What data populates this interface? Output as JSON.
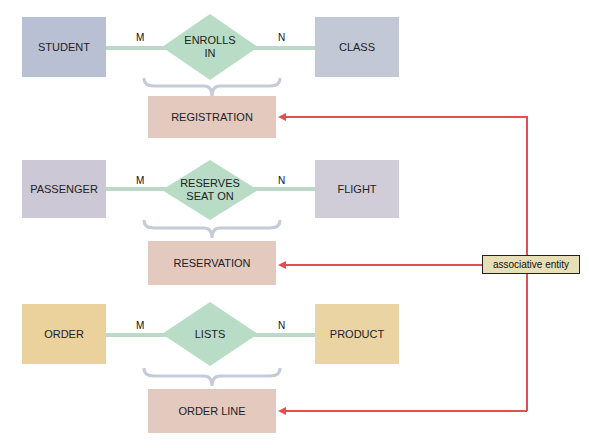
{
  "colors": {
    "student": "#b9c0d4",
    "class": "#c2c8d6",
    "passenger": "#cdc8d6",
    "flight": "#d0ccd8",
    "order": "#ebd19b",
    "product": "#ebd4a3",
    "relationship": "#b8dcc5",
    "associative": "#e4c9bf",
    "connector": "#bcd9c7",
    "arrow": "#e05050",
    "label_bg": "#e6dfb8"
  },
  "rows": [
    {
      "left_entity": "STUDENT",
      "right_entity": "CLASS",
      "relationship": "ENROLLS\nIN",
      "left_cardinality": "M",
      "right_cardinality": "N",
      "associative_entity": "REGISTRATION"
    },
    {
      "left_entity": "PASSENGER",
      "right_entity": "FLIGHT",
      "relationship": "RESERVES\nSEAT ON",
      "left_cardinality": "M",
      "right_cardinality": "N",
      "associative_entity": "RESERVATION"
    },
    {
      "left_entity": "ORDER",
      "right_entity": "PRODUCT",
      "relationship": "LISTS",
      "left_cardinality": "M",
      "right_cardinality": "N",
      "associative_entity": "ORDER LINE"
    }
  ],
  "callout": {
    "label": "associative entity"
  }
}
